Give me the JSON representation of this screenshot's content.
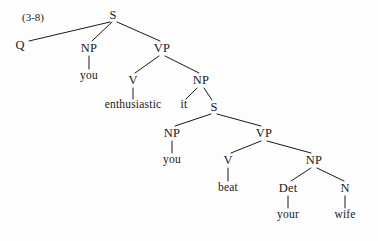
{
  "figure": {
    "label": "(3-8)",
    "label_x": 22,
    "label_y": 12,
    "width": 378,
    "height": 241,
    "background_color": "#fdfdfd",
    "ink_color": "#1a1a1a",
    "sentence": "Q you enthusiastic it you beat your wife"
  },
  "tree": {
    "type": "constituency-syntax-tree",
    "nodes": [
      {
        "id": "n0",
        "label": "S",
        "kind": "category",
        "x": 113,
        "y": 15
      },
      {
        "id": "n1",
        "label": "Q",
        "kind": "category",
        "x": 20,
        "y": 45
      },
      {
        "id": "n2",
        "label": "NP",
        "kind": "category",
        "x": 89,
        "y": 48
      },
      {
        "id": "n3",
        "label": "VP",
        "kind": "category",
        "x": 162,
        "y": 48
      },
      {
        "id": "n4",
        "label": "you",
        "kind": "terminal",
        "x": 89,
        "y": 76
      },
      {
        "id": "n5",
        "label": "V",
        "kind": "category",
        "x": 133,
        "y": 80
      },
      {
        "id": "n6",
        "label": "NP",
        "kind": "category",
        "x": 201,
        "y": 80
      },
      {
        "id": "n7",
        "label": "enthusiastic",
        "kind": "terminal",
        "x": 133,
        "y": 105
      },
      {
        "id": "n8",
        "label": "it",
        "kind": "terminal",
        "x": 184,
        "y": 105
      },
      {
        "id": "n9",
        "label": "S",
        "kind": "category",
        "x": 214,
        "y": 107
      },
      {
        "id": "n10",
        "label": "NP",
        "kind": "category",
        "x": 172,
        "y": 133
      },
      {
        "id": "n11",
        "label": "VP",
        "kind": "category",
        "x": 264,
        "y": 133
      },
      {
        "id": "n12",
        "label": "you",
        "kind": "terminal",
        "x": 172,
        "y": 160
      },
      {
        "id": "n13",
        "label": "V",
        "kind": "category",
        "x": 228,
        "y": 160
      },
      {
        "id": "n14",
        "label": "NP",
        "kind": "category",
        "x": 314,
        "y": 160
      },
      {
        "id": "n15",
        "label": "beat",
        "kind": "terminal",
        "x": 228,
        "y": 188
      },
      {
        "id": "n16",
        "label": "Det",
        "kind": "category",
        "x": 288,
        "y": 188
      },
      {
        "id": "n17",
        "label": "N",
        "kind": "category",
        "x": 345,
        "y": 188
      },
      {
        "id": "n18",
        "label": "your",
        "kind": "terminal",
        "x": 288,
        "y": 215
      },
      {
        "id": "n19",
        "label": "wife",
        "kind": "terminal",
        "x": 345,
        "y": 215
      }
    ],
    "edges": [
      {
        "from": "n0",
        "to": "n1",
        "x1": 110,
        "y1": 22,
        "x2": 29,
        "y2": 41
      },
      {
        "from": "n0",
        "to": "n2",
        "x1": 112,
        "y1": 22,
        "x2": 92,
        "y2": 41
      },
      {
        "from": "n0",
        "to": "n3",
        "x1": 117,
        "y1": 22,
        "x2": 160,
        "y2": 41
      },
      {
        "from": "n2",
        "to": "n4",
        "x1": 89,
        "y1": 56,
        "x2": 89,
        "y2": 69
      },
      {
        "from": "n3",
        "to": "n5",
        "x1": 159,
        "y1": 56,
        "x2": 135,
        "y2": 73
      },
      {
        "from": "n3",
        "to": "n6",
        "x1": 165,
        "y1": 56,
        "x2": 199,
        "y2": 73
      },
      {
        "from": "n5",
        "to": "n7",
        "x1": 133,
        "y1": 88,
        "x2": 133,
        "y2": 99
      },
      {
        "from": "n6",
        "to": "n8",
        "x1": 197,
        "y1": 88,
        "x2": 186,
        "y2": 99
      },
      {
        "from": "n6",
        "to": "n9",
        "x1": 204,
        "y1": 88,
        "x2": 212,
        "y2": 100
      },
      {
        "from": "n9",
        "to": "n10",
        "x1": 211,
        "y1": 114,
        "x2": 175,
        "y2": 126
      },
      {
        "from": "n9",
        "to": "n11",
        "x1": 217,
        "y1": 114,
        "x2": 261,
        "y2": 126
      },
      {
        "from": "n10",
        "to": "n12",
        "x1": 172,
        "y1": 141,
        "x2": 172,
        "y2": 153
      },
      {
        "from": "n11",
        "to": "n13",
        "x1": 261,
        "y1": 141,
        "x2": 231,
        "y2": 153
      },
      {
        "from": "n11",
        "to": "n14",
        "x1": 267,
        "y1": 141,
        "x2": 311,
        "y2": 153
      },
      {
        "from": "n13",
        "to": "n15",
        "x1": 228,
        "y1": 168,
        "x2": 228,
        "y2": 181
      },
      {
        "from": "n14",
        "to": "n16",
        "x1": 311,
        "y1": 168,
        "x2": 291,
        "y2": 181
      },
      {
        "from": "n14",
        "to": "n17",
        "x1": 317,
        "y1": 168,
        "x2": 344,
        "y2": 181
      },
      {
        "from": "n16",
        "to": "n18",
        "x1": 288,
        "y1": 196,
        "x2": 288,
        "y2": 208
      },
      {
        "from": "n17",
        "to": "n19",
        "x1": 345,
        "y1": 196,
        "x2": 345,
        "y2": 208
      }
    ]
  }
}
